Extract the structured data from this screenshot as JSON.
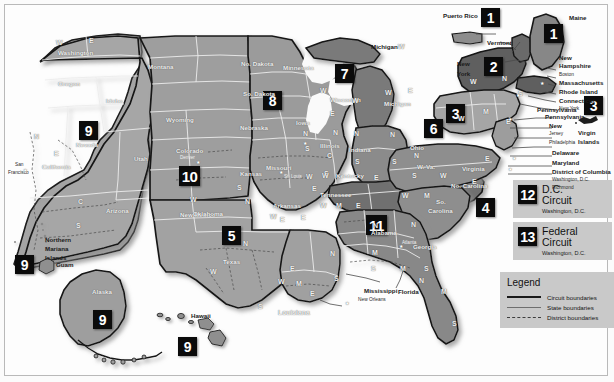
{
  "legend": {
    "title": "Legend",
    "items": [
      {
        "key": "circuit-boundaries",
        "label": "Circuit boundaries"
      },
      {
        "key": "state-boundaries",
        "label": "State boundaries"
      },
      {
        "key": "district-boundaries",
        "label": "District boundaries"
      }
    ]
  },
  "special_circuits": [
    {
      "number": "12",
      "name_line1": "D.C.",
      "name_line2": "Circuit",
      "location": "Washington, D.C."
    },
    {
      "number": "13",
      "name_line1": "Federal",
      "name_line2": "Circuit",
      "location": "Washington, D.C."
    }
  ],
  "circuit_badges": [
    {
      "id": "badge-1-puerto-rico",
      "number": "1"
    },
    {
      "id": "badge-1-maine",
      "number": "1"
    },
    {
      "id": "badge-2-new-york",
      "number": "2"
    },
    {
      "id": "badge-3-mid-atlantic",
      "number": "3"
    },
    {
      "id": "badge-3-virgin-islands",
      "number": "3"
    },
    {
      "id": "badge-4-carolinas",
      "number": "4"
    },
    {
      "id": "badge-5-texas",
      "number": "5"
    },
    {
      "id": "badge-6-ohio",
      "number": "6"
    },
    {
      "id": "badge-7-wisconsin",
      "number": "7"
    },
    {
      "id": "badge-8-dakotas",
      "number": "8"
    },
    {
      "id": "badge-9-nevada",
      "number": "9"
    },
    {
      "id": "badge-9-pacific-islands",
      "number": "9"
    },
    {
      "id": "badge-9-alaska",
      "number": "9"
    },
    {
      "id": "badge-9-hawaii",
      "number": "9"
    },
    {
      "id": "badge-10-colorado",
      "number": "10"
    },
    {
      "id": "badge-11-alabama",
      "number": "11"
    }
  ],
  "state_labels": [
    "Washington",
    "Oregon",
    "Idaho",
    "Montana",
    "Nevada",
    "California",
    "Utah",
    "Wyoming",
    "Colorado",
    "Arizona",
    "New Mexico",
    "No. Dakota",
    "So. Dakota",
    "Nebraska",
    "Kansas",
    "Oklahoma",
    "Texas",
    "Minnesota",
    "Iowa",
    "Missouri",
    "Arkansas",
    "Louisiana",
    "Wisconsin",
    "Illinois",
    "Michigan",
    "Indiana",
    "Ohio",
    "Kentucky",
    "Tennessee",
    "Mississippi",
    "Alabama",
    "Georgia",
    "Florida",
    "So. Carolina",
    "No. Carolina",
    "Virginia",
    "W. Va.",
    "Pennsylvania",
    "New York",
    "Vermont",
    "Maine",
    "New Hampshire",
    "Massachusetts",
    "Rhode Island",
    "Connecticut",
    "New Jersey",
    "Delaware",
    "Maryland",
    "District of Columbia",
    "Puerto Rico",
    "Virgin Islands",
    "Alaska",
    "Hawaii",
    "Guam",
    "Northern Mariana Islands"
  ],
  "annotated_places": [
    {
      "name": "Puerto Rico"
    },
    {
      "name": "Maine"
    },
    {
      "name": "Vermont"
    },
    {
      "name": "New York"
    },
    {
      "name": "New Hampshire"
    },
    {
      "name": "Boston"
    },
    {
      "name": "Massachusetts"
    },
    {
      "name": "Rhode Island"
    },
    {
      "name": "Connecticut"
    },
    {
      "name": "New York"
    },
    {
      "name": "Pennsylvania"
    },
    {
      "name": "New Jersey"
    },
    {
      "name": "Philadelphia"
    },
    {
      "name": "Delaware"
    },
    {
      "name": "Maryland"
    },
    {
      "name": "District of Columbia"
    },
    {
      "name": "Washington, D.C."
    },
    {
      "name": "Richmond"
    },
    {
      "name": "Virgin Islands"
    },
    {
      "name": "Michigan"
    },
    {
      "name": "Mississippi"
    },
    {
      "name": "Florida"
    },
    {
      "name": "New Orleans"
    },
    {
      "name": "Louisiana"
    },
    {
      "name": "Northern Mariana Islands"
    },
    {
      "name": "Guam"
    },
    {
      "name": "Hawaii"
    },
    {
      "name": "San Francisco"
    },
    {
      "name": "Denver"
    },
    {
      "name": "St. Louis"
    },
    {
      "name": "Atlanta"
    }
  ],
  "map_labels": {
    "washington": "Washington",
    "oregon": "Oregon",
    "idaho": "Idaho",
    "montana": "Montana",
    "nevada": "Nevada",
    "california": "California",
    "utah": "Utah",
    "wyoming": "Wyoming",
    "colorado": "Colorado",
    "arizona": "Arizona",
    "new_mexico": "New Mexico",
    "no_dakota": "No. Dakota",
    "so_dakota": "So. Dakota",
    "nebraska": "Nebraska",
    "kansas": "Kansas",
    "oklahoma": "Oklahoma",
    "texas": "Texas",
    "minnesota": "Minnesota",
    "iowa": "Iowa",
    "missouri": "Missouri",
    "arkansas": "Arkansas",
    "louisiana": "Louisiana",
    "wisconsin": "Wisconsin",
    "illinois": "Illinois",
    "michigan_up": "Michigan",
    "michigan_lp": "Michigan",
    "indiana": "Indiana",
    "ohio": "Ohio",
    "kentucky": "Kentucky",
    "tennessee": "Tennessee",
    "mississippi": "Mississippi",
    "alabama": "Alabama",
    "georgia": "Georgia",
    "florida": "Florida",
    "so_carolina_1": "So.",
    "so_carolina_2": "Carolina",
    "no_carolina": "No. Carolina",
    "virginia": "Virginia",
    "w_va": "W. Va.",
    "pennsylvania": "Pennsylvania",
    "new_york_side": "New",
    "new_york_side2": "York",
    "vermont": "Vermont",
    "maine": "Maine",
    "new_hampshire_1": "New",
    "new_hampshire_2": "Hampshire",
    "massachusetts": "Massachusetts",
    "rhode_island": "Rhode Island",
    "connecticut": "Connecticut",
    "new_jersey_1": "New",
    "new_jersey_2": "Jersey",
    "delaware": "Delaware",
    "maryland": "Maryland",
    "dc": "District of Columbia",
    "washington_dc": "Washington, D.C.",
    "richmond": "Richmond",
    "new_york_city": "New York",
    "philadelphia": "Philadelphia",
    "boston": "Boston",
    "puerto_rico": "Puerto Rico",
    "virgin_islands_1": "Virgin",
    "virgin_islands_2": "Islands",
    "alaska": "Alaska",
    "hawaii": "Hawaii",
    "guam": "Guam",
    "nmi_1": "Northern",
    "nmi_2": "Mariana",
    "nmi_3": "Islands",
    "san_francisco_1": "San",
    "san_francisco_2": "Francisco",
    "denver": "Denver",
    "st_louis": "St. Louis",
    "atlanta": "Atlanta",
    "new_orleans": "New Orleans"
  },
  "district_letters": {
    "wa_w": "W",
    "wa_e": "E",
    "ca_n": "N",
    "ca_e": "E",
    "ca_c": "C",
    "ca_s": "S",
    "nv_e": "E",
    "az_c": "C",
    "az_s": "S",
    "tx_n": "N",
    "tx_w": "W",
    "tx_e": "E",
    "tx_s": "S",
    "ok_w": "W",
    "ok_n": "N",
    "ok_e": "E",
    "ks_s": "S",
    "ia_n": "N",
    "ia_s": "S",
    "mo_w": "W",
    "mo_e": "E",
    "ar_w": "W",
    "ar_e": "E",
    "la_w": "W",
    "la_m": "M",
    "la_e": "E",
    "ms_n": "N",
    "ms_s": "S",
    "wi_w": "W",
    "wi_e": "E",
    "il_n": "N",
    "il_c": "C",
    "il_s": "S",
    "in_n": "N",
    "in_s": "S",
    "mi_w": "W",
    "mi_e": "E",
    "mi_up_w": "W",
    "oh_n": "N",
    "oh_s": "S",
    "ky_w": "W",
    "ky_e": "E",
    "tn_w": "W",
    "tn_m": "M",
    "tn_e": "E",
    "al_n": "N",
    "al_m": "M",
    "al_s": "S",
    "ga_n": "N",
    "ga_m": "M",
    "ga_s": "S",
    "fl_n": "N",
    "fl_m": "M",
    "fl_s": "S",
    "nc_w": "W",
    "nc_m": "M",
    "nc_e": "E",
    "va_w": "W",
    "va_e": "E",
    "wv_n": "N",
    "wv_s": "S",
    "pa_w": "W",
    "pa_m": "M",
    "pa_e": "E",
    "ny_w": "W",
    "ny_n": "N",
    "ny_s": "S",
    "ny_e": "E"
  },
  "colors": {
    "land_light": "#a9a9a9",
    "land_mid": "#9a9a9a",
    "land_dark": "#6f6f6f",
    "badge_bg": "#0b0b0b",
    "badge_fg": "#ffffff",
    "panel_bg": "#c9c9c9",
    "page_bg": "#fbfbfb",
    "frame_border": "#b9b9b9"
  }
}
